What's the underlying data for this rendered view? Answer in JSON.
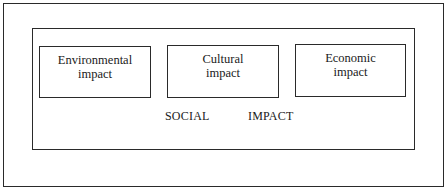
{
  "diagram": {
    "boxes": [
      {
        "line1": "Environmental",
        "line2": "impact"
      },
      {
        "line1": "Cultural",
        "line2": "impact"
      },
      {
        "line1": "Economic",
        "line2": "impact"
      }
    ],
    "caption": {
      "word1": "SOCIAL",
      "word2": "IMPACT"
    }
  }
}
